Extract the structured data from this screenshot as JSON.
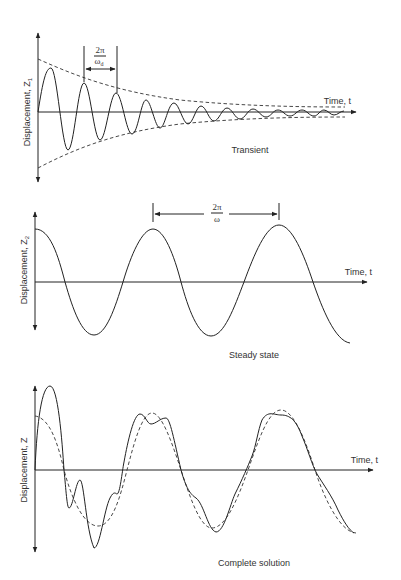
{
  "figure": {
    "panels": [
      {
        "id": "transient",
        "y_axis_label": "Displacement, Z",
        "y_axis_subscript": "1",
        "x_axis_label": "Time, t",
        "caption": "Transient",
        "period_label": {
          "numerator": "2π",
          "denominator": "ω",
          "denominator_subscript": "d"
        },
        "curves": [
          "damped oscillation (solid)",
          "exponential envelope (dashed)"
        ]
      },
      {
        "id": "steady-state",
        "y_axis_label": "Displacement, Z",
        "y_axis_subscript": "2",
        "x_axis_label": "Time, t",
        "caption": "Steady state",
        "period_label": {
          "numerator": "2π",
          "denominator": "ω"
        },
        "curves": [
          "sinusoid (solid)"
        ]
      },
      {
        "id": "complete-solution",
        "y_axis_label": "Displacement, Z",
        "x_axis_label": "Time, t",
        "caption": "Complete solution",
        "curves": [
          "total response (solid)",
          "steady-state response (dashed)"
        ]
      }
    ],
    "footer_caption": ""
  },
  "colors": {
    "ink": "#222222",
    "background": "#ffffff"
  }
}
